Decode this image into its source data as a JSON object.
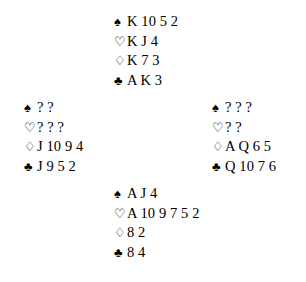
{
  "diagram": {
    "type": "bridge-deal",
    "background_color": "#ffffff",
    "text_color": "#000000",
    "unknown_card_marker": "?",
    "suit_symbols": {
      "spades": "♠",
      "hearts": "♡",
      "diamonds": "♢",
      "clubs": "♣"
    },
    "suit_fill": {
      "spades": "solid",
      "hearts": "outline",
      "diamonds": "outline",
      "clubs": "solid"
    }
  },
  "hands": {
    "north": {
      "position": "north",
      "suits": [
        {
          "suit": "spades",
          "symbol": "♠",
          "cards": "K 10 5 2",
          "count": 4
        },
        {
          "suit": "hearts",
          "symbol": "♡",
          "cards": "K J 4",
          "count": 3
        },
        {
          "suit": "diamonds",
          "symbol": "♢",
          "cards": "K 7 3",
          "count": 3
        },
        {
          "suit": "clubs",
          "symbol": "♣",
          "cards": "A K 3",
          "count": 3
        }
      ]
    },
    "west": {
      "position": "west",
      "suits": [
        {
          "suit": "spades",
          "symbol": "♠",
          "cards": "? ?",
          "count": 2
        },
        {
          "suit": "hearts",
          "symbol": "♡",
          "cards": "? ? ?",
          "count": 3
        },
        {
          "suit": "diamonds",
          "symbol": "♢",
          "cards": "J 10 9 4",
          "count": 4
        },
        {
          "suit": "clubs",
          "symbol": "♣",
          "cards": "J 9 5 2",
          "count": 4
        }
      ]
    },
    "east": {
      "position": "east",
      "suits": [
        {
          "suit": "spades",
          "symbol": "♠",
          "cards": "? ? ?",
          "count": 3
        },
        {
          "suit": "hearts",
          "symbol": "♡",
          "cards": "? ?",
          "count": 2
        },
        {
          "suit": "diamonds",
          "symbol": "♢",
          "cards": "A Q 6 5",
          "count": 4
        },
        {
          "suit": "clubs",
          "symbol": "♣",
          "cards": "Q 10 7 6",
          "count": 4
        }
      ]
    },
    "south": {
      "position": "south",
      "suits": [
        {
          "suit": "spades",
          "symbol": "♠",
          "cards": "A J 4",
          "count": 3
        },
        {
          "suit": "hearts",
          "symbol": "♡",
          "cards": "A 10 9 7 5 2",
          "count": 6
        },
        {
          "suit": "diamonds",
          "symbol": "♢",
          "cards": "8 2",
          "count": 2
        },
        {
          "suit": "clubs",
          "symbol": "♣",
          "cards": "8 4",
          "count": 2
        }
      ]
    }
  }
}
